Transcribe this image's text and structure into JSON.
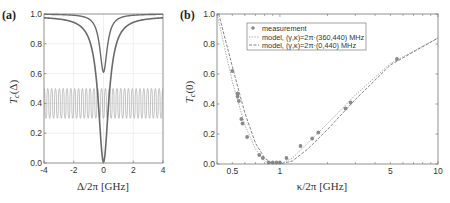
{
  "panels": {
    "a": {
      "label": "(a)",
      "ylabel": "T_c(Δ)",
      "ylabel_main": "T",
      "ylabel_sub": "c",
      "ylabel_arg": "(Δ)",
      "xlabel": "Δ/2π  [GHz]",
      "xticks": [
        "-4",
        "-2",
        "0",
        "2",
        "4"
      ],
      "yticks": [
        "0.0",
        "0.2",
        "0.4",
        "0.6",
        "0.8",
        "1.0"
      ]
    },
    "b": {
      "label": "(b)",
      "ylabel": "T_c(0)",
      "ylabel_main": "T",
      "ylabel_sub": "c",
      "ylabel_arg": "(0)",
      "xlabel": "κ/2π  [GHz]",
      "xticks": [
        "0.5",
        "1",
        "5",
        "10"
      ],
      "yticks": [
        "0.0",
        "0.2",
        "0.4",
        "0.6",
        "0.8",
        "1.0"
      ],
      "legend": [
        "measurement",
        "model, (γ,κ)=2π·(360,440) MHz",
        "model, (γ,κ)=2π·(0,440) MHz"
      ]
    }
  },
  "chart_data": [
    {
      "type": "line",
      "title": "(a)",
      "xlabel": "Δ/2π [GHz]",
      "ylabel": "T_c(Δ)",
      "xlim": [
        -4,
        4
      ],
      "ylim": [
        0.0,
        1.0
      ],
      "grid": true,
      "series": [
        {
          "name": "narrow dip (min ≈0.6)",
          "x": [
            -4,
            -2,
            -1,
            -0.5,
            -0.3,
            0,
            0.3,
            0.5,
            1,
            2,
            4
          ],
          "y": [
            1.0,
            0.99,
            0.97,
            0.9,
            0.75,
            0.61,
            0.75,
            0.9,
            0.97,
            0.99,
            1.0
          ]
        },
        {
          "name": "broad dip (min ≈0.0)",
          "x": [
            -4,
            -3,
            -2,
            -1,
            -0.6,
            -0.3,
            0,
            0.3,
            0.6,
            1,
            2,
            3,
            4
          ],
          "y": [
            0.97,
            0.96,
            0.93,
            0.82,
            0.55,
            0.2,
            0.0,
            0.2,
            0.55,
            0.82,
            0.93,
            0.96,
            0.97
          ]
        },
        {
          "name": "oscillating trace",
          "x_range": [
            -4,
            4
          ],
          "y_range": [
            0.3,
            0.5
          ],
          "periods": 31
        }
      ]
    },
    {
      "type": "scatter",
      "title": "(b)",
      "xlabel": "κ/2π [GHz]",
      "ylabel": "T_c(0)",
      "xscale": "log",
      "xlim": [
        0.4,
        10
      ],
      "ylim": [
        0.0,
        1.0
      ],
      "legend_position": "upper center",
      "series": [
        {
          "name": "measurement",
          "x": [
            0.5,
            0.54,
            0.54,
            0.55,
            0.57,
            0.58,
            0.62,
            0.74,
            0.78,
            0.85,
            0.9,
            0.95,
            1.0,
            1.1,
            1.35,
            1.6,
            1.75,
            2.6,
            2.8,
            5.5
          ],
          "y": [
            0.62,
            0.47,
            0.45,
            0.42,
            0.3,
            0.27,
            0.18,
            0.06,
            0.04,
            0.01,
            0.01,
            0.01,
            0.01,
            0.04,
            0.12,
            0.17,
            0.21,
            0.37,
            0.41,
            0.7
          ]
        },
        {
          "name": "model, (γ,κ)=2π·(360,440) MHz",
          "x": [
            0.4,
            0.5,
            0.6,
            0.7,
            0.8,
            0.9,
            1.0,
            1.2,
            1.5,
            2,
            3,
            5,
            10
          ],
          "y": [
            1.0,
            0.55,
            0.26,
            0.1,
            0.02,
            0.0,
            0.0,
            0.04,
            0.14,
            0.27,
            0.46,
            0.67,
            0.84
          ]
        },
        {
          "name": "model, (γ,κ)=2π·(0,440) MHz",
          "x": [
            0.41,
            0.5,
            0.6,
            0.7,
            0.8,
            0.9,
            1.0,
            1.2,
            1.5,
            2,
            3,
            5,
            10
          ],
          "y": [
            1.0,
            0.65,
            0.34,
            0.14,
            0.04,
            0.0,
            0.0,
            0.02,
            0.1,
            0.23,
            0.43,
            0.66,
            0.84
          ]
        }
      ]
    }
  ]
}
